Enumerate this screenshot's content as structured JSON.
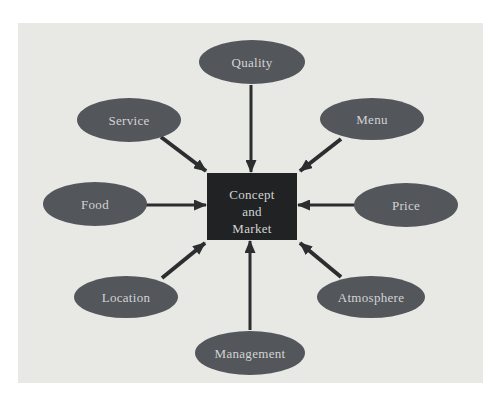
{
  "diagram": {
    "colors": {
      "page_bg": "#ffffff",
      "panel_bg": "#e8e8e5",
      "ellipse_fill": "#53565a",
      "rect_fill": "#212223",
      "arrow": "#2b2d2e",
      "label_text": "#d2d4d5"
    },
    "panel": {
      "x": 18,
      "y": 23,
      "w": 465,
      "h": 360
    },
    "center": {
      "label_lines": [
        "Concept",
        "and",
        "Market"
      ],
      "rect": {
        "x": 207,
        "y": 173,
        "w": 90,
        "h": 67
      },
      "baselines": [
        199,
        216,
        233
      ],
      "text_x": 252
    },
    "nodes": [
      {
        "id": "quality",
        "label": "Quality",
        "cx": 252,
        "cy": 62,
        "rx": 53,
        "ry": 22,
        "arrow": {
          "x1": 251,
          "y1": 85,
          "x2": 251,
          "y2": 172,
          "w": 3
        }
      },
      {
        "id": "menu",
        "label": "Menu",
        "cx": 372,
        "cy": 119,
        "rx": 52,
        "ry": 21,
        "arrow": {
          "x1": 341,
          "y1": 139,
          "x2": 300,
          "y2": 171,
          "w": 4
        }
      },
      {
        "id": "price",
        "label": "Price",
        "cx": 406,
        "cy": 205,
        "rx": 52,
        "ry": 22,
        "arrow": {
          "x1": 356,
          "y1": 205,
          "x2": 298,
          "y2": 205,
          "w": 3
        }
      },
      {
        "id": "atmosphere",
        "label": "Atmosphere",
        "cx": 371,
        "cy": 297,
        "rx": 54,
        "ry": 21,
        "arrow": {
          "x1": 341,
          "y1": 277,
          "x2": 300,
          "y2": 243,
          "w": 4
        }
      },
      {
        "id": "management",
        "label": "Management",
        "cx": 250,
        "cy": 353,
        "rx": 55,
        "ry": 22,
        "arrow": {
          "x1": 250,
          "y1": 330,
          "x2": 250,
          "y2": 241,
          "w": 3
        }
      },
      {
        "id": "location",
        "label": "Location",
        "cx": 126,
        "cy": 297,
        "rx": 52,
        "ry": 21,
        "arrow": {
          "x1": 162,
          "y1": 278,
          "x2": 205,
          "y2": 243,
          "w": 4
        }
      },
      {
        "id": "food",
        "label": "Food",
        "cx": 95,
        "cy": 204,
        "rx": 52,
        "ry": 22,
        "arrow": {
          "x1": 146,
          "y1": 205,
          "x2": 206,
          "y2": 205,
          "w": 3
        }
      },
      {
        "id": "service",
        "label": "Service",
        "cx": 129,
        "cy": 120,
        "rx": 52,
        "ry": 22,
        "arrow": {
          "x1": 161,
          "y1": 137,
          "x2": 206,
          "y2": 171,
          "w": 4
        }
      }
    ]
  }
}
